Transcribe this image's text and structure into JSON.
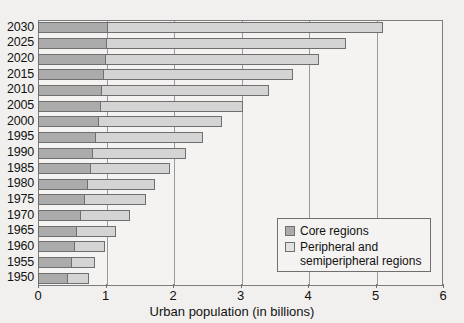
{
  "chart_data": {
    "type": "bar",
    "orientation": "horizontal",
    "stacked": true,
    "title": "",
    "xlabel": "Urban population (in billions)",
    "ylabel": "",
    "xlim": [
      0,
      6
    ],
    "xticks": [
      0,
      1,
      2,
      3,
      4,
      5,
      6
    ],
    "xtick_labels": [
      "0",
      "1",
      "2",
      "3",
      "4",
      "5",
      "6"
    ],
    "grid": true,
    "legend_position": "lower right",
    "categories": [
      "2030",
      "2025",
      "2020",
      "2015",
      "2010",
      "2005",
      "2000",
      "1995",
      "1990",
      "1985",
      "1980",
      "1975",
      "1970",
      "1965",
      "1960",
      "1955",
      "1950"
    ],
    "series": [
      {
        "name": "Core regions",
        "color": "#ababab",
        "values": [
          1.03,
          1.02,
          1.0,
          0.98,
          0.95,
          0.93,
          0.9,
          0.86,
          0.82,
          0.78,
          0.74,
          0.69,
          0.64,
          0.58,
          0.55,
          0.5,
          0.45
        ]
      },
      {
        "name": "Peripheral and semiperipheral regions",
        "color": "#d4d4d4",
        "values": [
          4.08,
          3.54,
          3.16,
          2.8,
          2.47,
          2.1,
          1.83,
          1.59,
          1.38,
          1.18,
          1.0,
          0.91,
          0.73,
          0.57,
          0.44,
          0.35,
          0.3
        ]
      }
    ],
    "totals": [
      5.11,
      4.56,
      4.16,
      3.78,
      3.42,
      3.03,
      2.73,
      2.45,
      2.2,
      1.96,
      1.74,
      1.6,
      1.37,
      1.15,
      0.99,
      0.85,
      0.75
    ]
  },
  "legend": {
    "items": [
      {
        "label": "Core regions",
        "swatch": "core-swatch"
      },
      {
        "label": "Peripheral and",
        "label2": "semiperipheral regions",
        "swatch": "peripheral-swatch"
      }
    ]
  },
  "axis": {
    "x_title": "Urban population (in billions)"
  }
}
